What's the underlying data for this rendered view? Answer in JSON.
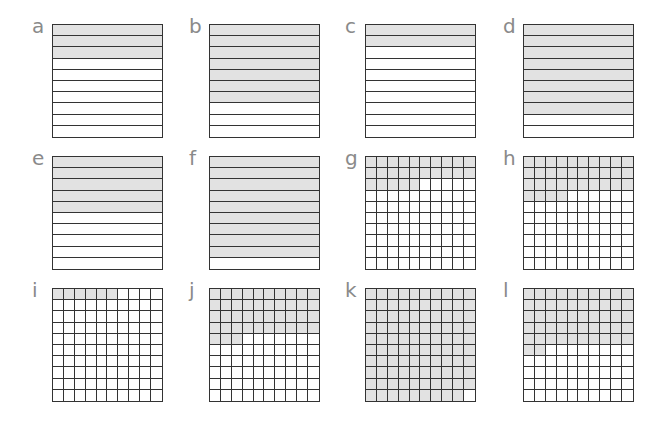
{
  "figure": {
    "panels": [
      {
        "label": "a",
        "type": "tenths",
        "shaded": 3,
        "total": 10
      },
      {
        "label": "b",
        "type": "tenths",
        "shaded": 7,
        "total": 10
      },
      {
        "label": "c",
        "type": "tenths",
        "shaded": 2,
        "total": 10
      },
      {
        "label": "d",
        "type": "tenths",
        "shaded": 8,
        "total": 10
      },
      {
        "label": "e",
        "type": "tenths",
        "shaded": 5,
        "total": 10
      },
      {
        "label": "f",
        "type": "tenths",
        "shaded": 9,
        "total": 10
      },
      {
        "label": "g",
        "type": "hundredths",
        "shaded": 25,
        "total": 100
      },
      {
        "label": "h",
        "type": "hundredths",
        "shaded": 34,
        "total": 100
      },
      {
        "label": "i",
        "type": "hundredths",
        "shaded": 6,
        "total": 100
      },
      {
        "label": "j",
        "type": "hundredths",
        "shaded": 43,
        "total": 100
      },
      {
        "label": "k",
        "type": "hundredths",
        "shaded": 99,
        "total": 100
      },
      {
        "label": "l",
        "type": "hundredths",
        "shaded": 52,
        "total": 100
      }
    ],
    "colors": {
      "shade": "#e2e2e2",
      "line": "#333333",
      "label": "#8a8a8a"
    }
  }
}
